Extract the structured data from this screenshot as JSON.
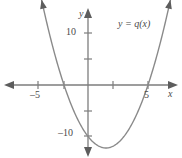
{
  "figure": {
    "background_color": "#ffffff",
    "curve_color": "#8a8a8a",
    "axis_color": "#7d7d7d",
    "text_color": "#4a4a4a"
  },
  "labels": {
    "axis_x_name": "x",
    "axis_y_name": "y",
    "curve_label": "y = q(x)",
    "x_tick_neg5": "–5",
    "x_tick_pos5": "5",
    "y_tick_10": "10",
    "y_tick_neg10": "–10"
  },
  "chart_data": {
    "type": "line",
    "title": "",
    "subtitle": "",
    "xlabel": "x",
    "ylabel": "y",
    "xlim": [
      -7.3,
      7.8
    ],
    "ylim": [
      -14.3,
      16.6
    ],
    "grid": false,
    "legend_position": "inside-upper-right",
    "annotations": [
      {
        "text": "y = q(x)",
        "x": 3.2,
        "y": 12.5
      }
    ],
    "x_ticks": [
      -5,
      -2,
      2,
      5
    ],
    "x_tick_labels": [
      "–5",
      "",
      "",
      "5"
    ],
    "y_ticks": [
      -10,
      -5,
      5,
      10
    ],
    "y_tick_labels": [
      "–10",
      "",
      "",
      "10"
    ],
    "series": [
      {
        "name": "q(x)",
        "type": "parabola",
        "equation": "y = x^2 - 3x - 10",
        "orientation": "opens-upward",
        "vertex": [
          1.5,
          -12.25
        ],
        "roots": [
          -2,
          5
        ],
        "y_intercept": -10,
        "color": "#8a8a8a",
        "x": [
          -3.0,
          -2.5,
          -2.0,
          -1.5,
          -1.0,
          -0.5,
          0.0,
          0.5,
          1.0,
          1.5,
          2.0,
          2.5,
          3.0,
          3.5,
          4.0,
          4.5,
          5.0,
          5.5,
          6.0
        ],
        "values": [
          8.0,
          3.75,
          0.0,
          -3.25,
          -6.0,
          -8.25,
          -10.0,
          -11.25,
          -12.0,
          -12.25,
          -12.0,
          -11.25,
          -10.0,
          -8.25,
          -6.0,
          -3.25,
          0.0,
          3.75,
          8.0
        ]
      }
    ]
  }
}
